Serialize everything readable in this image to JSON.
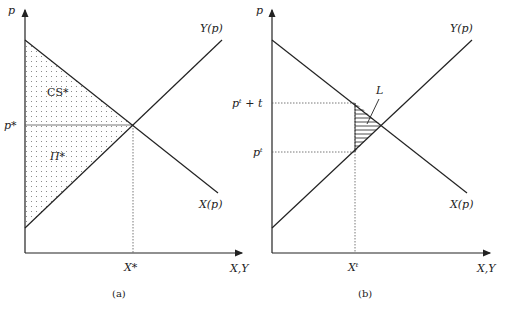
{
  "panels": [
    {
      "id": "a",
      "caption": "(a)",
      "y_axis_label": "p",
      "x_axis_label": "X,Y",
      "supply_label": "Y(p)",
      "demand_label": "X(p)",
      "price_label": "p*",
      "quantity_label": "X*",
      "region_upper_label": "CS*",
      "region_lower_label": "Π*"
    },
    {
      "id": "b",
      "caption": "(b)",
      "y_axis_label": "p",
      "x_axis_label": "X,Y",
      "supply_label": "Y(p)",
      "demand_label": "X(p)",
      "upper_price_label": "pᵗ + t",
      "lower_price_label": "pᵗ",
      "quantity_label": "Xᵗ",
      "loss_label": "L"
    }
  ],
  "colors": {
    "line": "#222222",
    "dotted": "#555555",
    "fill_dots": "#777777"
  }
}
